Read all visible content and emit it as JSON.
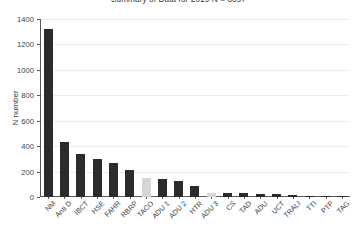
{
  "chart_data": {
    "type": "bar",
    "title": "Summary of Data for 2019 N = 3397",
    "xlabel": "",
    "ylabel": "N number",
    "ylim": [
      0,
      1400
    ],
    "yticks": [
      0,
      200,
      400,
      600,
      800,
      1000,
      1200,
      1400
    ],
    "grid": true,
    "legend": "none",
    "bar_color": "#2b2b2b",
    "highlight_color": "#d6d6d6",
    "categories": [
      "NM",
      "Anti D",
      "IBCT",
      "HSE",
      "FAHR",
      "RBRP",
      "TACO",
      "ADU 1",
      "ADU 2",
      "HTR",
      "ADU 3",
      "CS",
      "TAD",
      "ADU",
      "UCT",
      "TRALI",
      "TTI",
      "PTP",
      "TAG"
    ],
    "values": [
      1320,
      430,
      340,
      300,
      270,
      215,
      150,
      140,
      125,
      85,
      35,
      30,
      28,
      25,
      22,
      15,
      10,
      8,
      6
    ],
    "highlighted": [
      "TACO",
      "ADU 3"
    ]
  }
}
